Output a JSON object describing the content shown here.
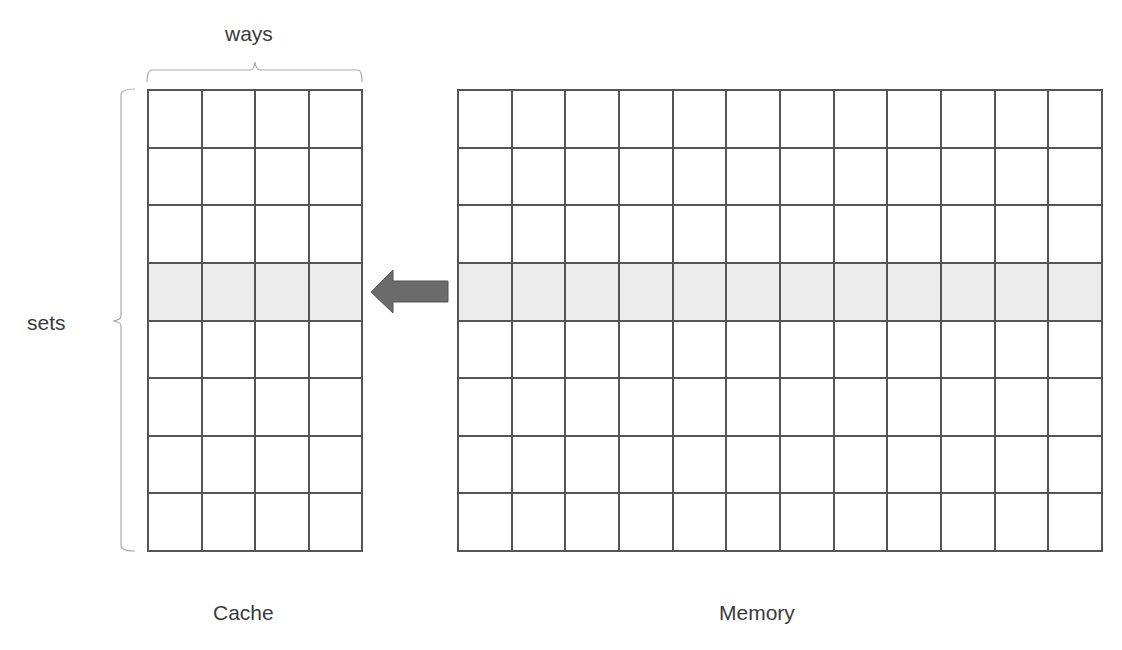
{
  "diagram": {
    "labels": {
      "ways": "ways",
      "sets": "sets",
      "cache": "Cache",
      "memory": "Memory"
    },
    "cache": {
      "rows": 8,
      "cols": 4,
      "highlighted_row": 3
    },
    "memory": {
      "rows": 8,
      "cols": 12,
      "highlighted_row": 3
    },
    "arrow": {
      "direction": "left",
      "from": "memory",
      "to": "cache",
      "color": "#6b6b6b"
    },
    "colors": {
      "grid_line": "#555555",
      "highlight": "#ececec",
      "bracket": "#aaaaaa",
      "text": "#3a3a3a"
    }
  }
}
